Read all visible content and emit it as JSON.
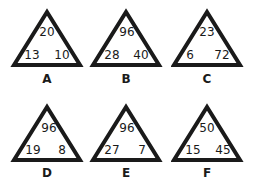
{
  "puzzles": [
    {
      "label": "A",
      "top": "20",
      "left": "13",
      "right": "10"
    },
    {
      "label": "B",
      "top": "96",
      "left": "28",
      "right": "40"
    },
    {
      "label": "C",
      "top": "23",
      "left": "6",
      "right": "72"
    },
    {
      "label": "D",
      "top": "96",
      "left": "19",
      "right": "8"
    },
    {
      "label": "E",
      "top": "96",
      "left": "27",
      "right": "7"
    },
    {
      "label": "F",
      "top": "50",
      "left": "15",
      "right": "45"
    }
  ],
  "colors": {
    "stroke": "#1a1a1a",
    "background": "#ffffff"
  }
}
